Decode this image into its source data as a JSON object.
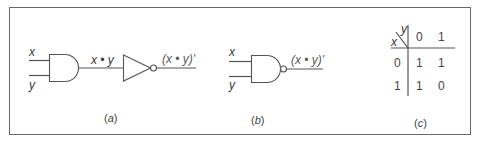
{
  "figure": {
    "border_color": "#6a6a6a",
    "line_color": "#555555",
    "text_color": "#3a3a3a"
  },
  "panel_a": {
    "input_x": "x",
    "input_y": "y",
    "intermediate_label": "x • y",
    "output_label": "(x • y)'",
    "caption_open": "(",
    "caption_letter": "a",
    "caption_close": ")"
  },
  "panel_b": {
    "input_x": "x",
    "input_y": "y",
    "output_label": "(x • y)'",
    "caption_open": "(",
    "caption_letter": "b",
    "caption_close": ")"
  },
  "panel_c": {
    "corner_col_var": "y",
    "corner_row_var": "x",
    "col_headers": [
      "0",
      "1"
    ],
    "rows": [
      {
        "header": "0",
        "cells": [
          "1",
          "1"
        ]
      },
      {
        "header": "1",
        "cells": [
          "1",
          "0"
        ]
      }
    ],
    "caption_open": "(",
    "caption_letter": "c",
    "caption_close": ")"
  }
}
